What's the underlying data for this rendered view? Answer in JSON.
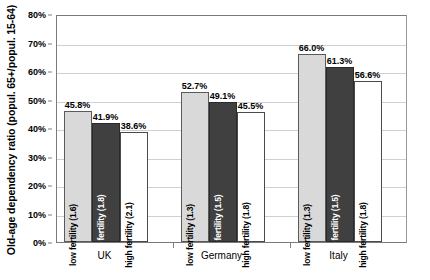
{
  "chart_data": {
    "type": "bar",
    "title": "",
    "subtitle": "",
    "xlabel": "",
    "ylabel": "Old-age dependency ratio (popul. 65+/popul. 15-64)",
    "categories": [
      "UK",
      "Germany",
      "Italy"
    ],
    "ylim": [
      0,
      80
    ],
    "ytick_labels": [
      "0%",
      "10%",
      "20%",
      "30%",
      "40%",
      "50%",
      "60%",
      "70%",
      "80%"
    ],
    "ytick_values": [
      0,
      10,
      20,
      30,
      40,
      50,
      60,
      70,
      80
    ],
    "grid": true,
    "legend": "none",
    "legend_position": "none",
    "value_label_suffix": "%",
    "series": [
      {
        "name": "low fertility",
        "style": "light-gray",
        "color": "#d9d9d9",
        "values": [
          45.8,
          41.9,
          38.6
        ],
        "bar_labels": [
          "low fertility (1.6)",
          "low fertility (1.3)",
          "low fertility (1.3)"
        ],
        "value_labels": [
          "45.8%",
          "52.7%",
          "66.0%"
        ]
      }
    ],
    "groups": [
      {
        "category": "UK",
        "bars": [
          {
            "label": "low fertility (1.6)",
            "value": 45.8,
            "value_label": "45.8%",
            "style": "light",
            "color": "#d9d9d9"
          },
          {
            "label": "baseline fertility (1.8)",
            "value": 41.9,
            "value_label": "41.9%",
            "style": "dark",
            "color": "#404040"
          },
          {
            "label": "high fertility (2.1)",
            "value": 38.6,
            "value_label": "38.6%",
            "style": "white",
            "color": "#ffffff"
          }
        ]
      },
      {
        "category": "Germany",
        "bars": [
          {
            "label": "low fertility (1.3)",
            "value": 52.7,
            "value_label": "52.7%",
            "style": "light",
            "color": "#d9d9d9"
          },
          {
            "label": "baseline fertility (1.5)",
            "value": 49.1,
            "value_label": "49.1%",
            "style": "dark",
            "color": "#404040"
          },
          {
            "label": "high fertility (1.8)",
            "value": 45.5,
            "value_label": "45.5%",
            "style": "white",
            "color": "#ffffff"
          }
        ]
      },
      {
        "category": "Italy",
        "bars": [
          {
            "label": "low fertility (1.3)",
            "value": 66.0,
            "value_label": "66.0%",
            "style": "light",
            "color": "#d9d9d9"
          },
          {
            "label": "baseline fertility (1.5)",
            "value": 61.3,
            "value_label": "61.3%",
            "style": "dark",
            "color": "#404040"
          },
          {
            "label": "high fertility (1.8)",
            "value": 56.6,
            "value_label": "56.6%",
            "style": "white",
            "color": "#ffffff"
          }
        ]
      }
    ],
    "colors": {
      "light_bar": "#d9d9d9",
      "dark_bar": "#404040",
      "white_bar": "#ffffff",
      "bar_outline": "#4a4a4a",
      "gridline": "#d0d0d0",
      "axis": "#7a7a7a",
      "background": "#ffffff",
      "text": "#000000"
    }
  }
}
